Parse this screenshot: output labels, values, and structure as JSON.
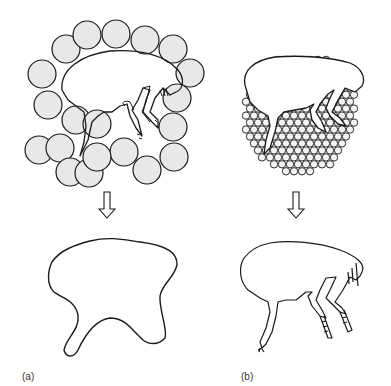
{
  "figure": {
    "panel_a": {
      "label": "(a)",
      "description": "Flea enclosed by large spheres; resulting cast shape is a coarse blob",
      "sphere_radius": 14,
      "spheres": [
        [
          66,
          49
        ],
        [
          87,
          35
        ],
        [
          116,
          34
        ],
        [
          145,
          40
        ],
        [
          173,
          49
        ],
        [
          190,
          73
        ],
        [
          42,
          74
        ],
        [
          48,
          105
        ],
        [
          76,
          120
        ],
        [
          177,
          98
        ],
        [
          173,
          127
        ],
        [
          174,
          157
        ],
        [
          39,
          150
        ],
        [
          60,
          148
        ],
        [
          70,
          172
        ],
        [
          89,
          173
        ],
        [
          97,
          124
        ],
        [
          124,
          152
        ],
        [
          97,
          157
        ],
        [
          147,
          170
        ]
      ]
    },
    "panel_b": {
      "label": "(b)",
      "description": "Flea enclosed by small spheres; resulting cast shape closely follows flea outline",
      "sphere_radius": 4
    },
    "arrows": [
      {
        "x": 107,
        "y_top": 192,
        "y_bottom": 218
      },
      {
        "x": 296,
        "y_top": 192,
        "y_bottom": 218
      }
    ],
    "colors": {
      "sphere_fill": "#e8e8e8",
      "stroke": "#1a1a1a",
      "background": "#ffffff"
    }
  }
}
